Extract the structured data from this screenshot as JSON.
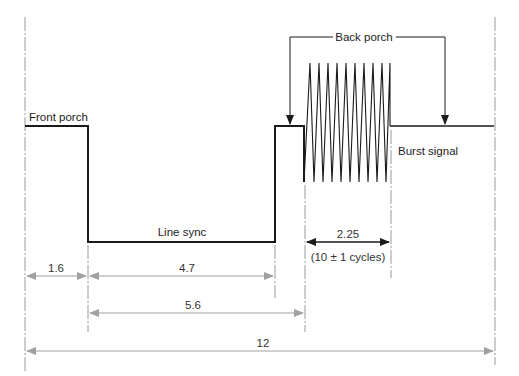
{
  "diagram": {
    "labels": {
      "front_porch": "Front porch",
      "back_porch": "Back porch",
      "line_sync": "Line sync",
      "burst_signal": "Burst signal"
    },
    "dimensions": {
      "front_porch": "1.6",
      "line_sync": "4.7",
      "sync_to_burst": "5.6",
      "burst": "2.25",
      "burst_cycles": "(10 ± 1 cycles)",
      "total": "12"
    },
    "burst_cycles_drawn": 10,
    "colors": {
      "signal": "#1a1a1a",
      "dimension": "#a0a0a0",
      "guide": "#9a9a9a"
    }
  }
}
